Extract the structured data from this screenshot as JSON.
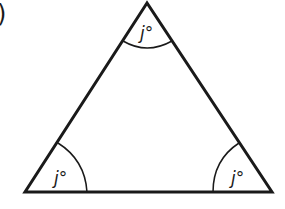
{
  "part_marker": ")",
  "triangle": {
    "vertices": {
      "top": [
        147,
        2
      ],
      "bottom_left": [
        25,
        192
      ],
      "bottom_right": [
        272,
        192
      ]
    },
    "stroke_color": "#1a1a1a"
  },
  "angles": [
    {
      "position": "top",
      "label": "j°"
    },
    {
      "position": "bottom-left",
      "label": "j°"
    },
    {
      "position": "bottom-right",
      "label": "j°"
    }
  ]
}
